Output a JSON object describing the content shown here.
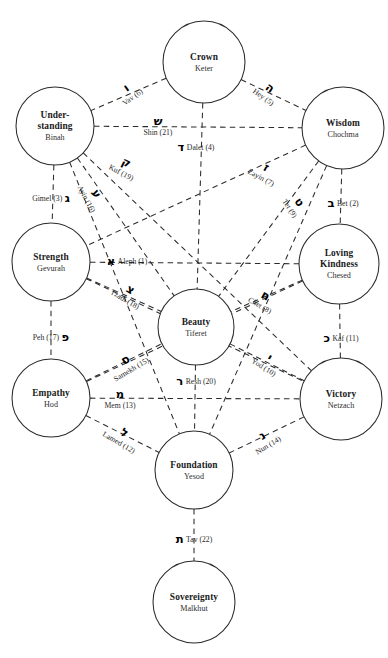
{
  "diagram": {
    "background": "#ffffff",
    "line_color": "#2b2b2b",
    "text_color": "#1b1b1b"
  },
  "sephirot": [
    {
      "id": "keter",
      "name": "Crown",
      "hebrew": "Keter",
      "cx": 204,
      "cy": 62,
      "r": 41
    },
    {
      "id": "binah",
      "name": "Under-\nstanding",
      "name_line1": "Under-",
      "name_line2": "standing",
      "hebrew": "Binah",
      "cx": 55,
      "cy": 126,
      "r": 39
    },
    {
      "id": "chochma",
      "name": "Wisdom",
      "hebrew": "Chochma",
      "cx": 343,
      "cy": 128,
      "r": 41
    },
    {
      "id": "gevurah",
      "name": "Strength",
      "hebrew": "Gevurah",
      "cx": 51,
      "cy": 262,
      "r": 39
    },
    {
      "id": "chesed",
      "name": "Loving\nKindness",
      "name_line1": "Loving",
      "name_line2": "Kindness",
      "hebrew": "Chesed",
      "cx": 339,
      "cy": 264,
      "r": 40
    },
    {
      "id": "tiferet",
      "name": "Beauty",
      "hebrew": "Tiferet",
      "cx": 196,
      "cy": 327,
      "r": 38
    },
    {
      "id": "hod",
      "name": "Empathy",
      "hebrew": "Hod",
      "cx": 51,
      "cy": 398,
      "r": 39
    },
    {
      "id": "netzach",
      "name": "Victory",
      "hebrew": "Netzach",
      "cx": 341,
      "cy": 399,
      "r": 41
    },
    {
      "id": "yesod",
      "name": "Foundation",
      "hebrew": "Yesod",
      "cx": 194,
      "cy": 470,
      "r": 39
    },
    {
      "id": "malkhut",
      "name": "Sovereignty",
      "hebrew": "Malkhut",
      "cx": 194,
      "cy": 602,
      "r": 41
    }
  ],
  "paths": [
    {
      "id": "aleph",
      "letter": "א",
      "name": "Aleph",
      "number": 1,
      "caption": "Aleph (1)",
      "from": "gevurah",
      "to": "chesed",
      "lx": 127,
      "ly": 262,
      "rot": 0,
      "glyph_side": "left",
      "stack": false
    },
    {
      "id": "bet",
      "letter": "ב",
      "name": "Bet",
      "number": 2,
      "caption": "Bet (2)",
      "from": "chochma",
      "to": "chesed",
      "lx": 343,
      "ly": 204,
      "rot": 0,
      "glyph_side": "left",
      "stack": false
    },
    {
      "id": "gimel",
      "letter": "ג",
      "name": "Gimel",
      "number": 3,
      "caption": "Gimel (3)",
      "from": "binah",
      "to": "gevurah",
      "lx": 51,
      "ly": 199,
      "rot": 0,
      "glyph_side": "right",
      "stack": false
    },
    {
      "id": "dalet",
      "letter": "ד",
      "name": "Dalet",
      "number": 4,
      "caption": "Dalet (4)",
      "from": "keter",
      "to": "tiferet",
      "lx": 196,
      "ly": 148,
      "rot": 0,
      "glyph_side": "left",
      "stack": false
    },
    {
      "id": "hey",
      "letter": "ה",
      "name": "Hey",
      "number": 5,
      "caption": "Hey (5)",
      "from": "keter",
      "to": "chochma",
      "lx": 267,
      "ly": 92,
      "rot": 35,
      "glyph_side": "left",
      "stack": true
    },
    {
      "id": "vav",
      "letter": "ו",
      "name": "Vav",
      "number": 6,
      "caption": "Vav (6)",
      "from": "keter",
      "to": "binah",
      "lx": 129,
      "ly": 92,
      "rot": -35,
      "glyph_side": "left",
      "stack": true
    },
    {
      "id": "zayin",
      "letter": "ז",
      "name": "Zayin",
      "number": 7,
      "caption": "Zayin (7)",
      "from": "chochma",
      "to": "tiferet",
      "lx": 264,
      "ly": 172,
      "rot": 28,
      "glyph_side": "left",
      "stack": true
    },
    {
      "id": "chet",
      "letter": "ח",
      "name": "Chet",
      "number": 8,
      "caption": "Chet (8)",
      "from": "chesed",
      "to": "tiferet",
      "lx": 263,
      "ly": 300,
      "rot": 30,
      "glyph_side": "left",
      "stack": true
    },
    {
      "id": "tet",
      "letter": "ט",
      "name": "Tet",
      "number": 9,
      "caption": "Tet (9)",
      "from": "chochma",
      "to": "gevurah",
      "lx": 295,
      "ly": 205,
      "rot": 57,
      "glyph_side": "left",
      "stack": true
    },
    {
      "id": "yod",
      "letter": "י",
      "name": "Yod",
      "number": 10,
      "caption": "Yod (10)",
      "from": "tiferet",
      "to": "netzach",
      "lx": 267,
      "ly": 362,
      "rot": 32,
      "glyph_side": "left",
      "stack": true
    },
    {
      "id": "kaf",
      "letter": "כ",
      "name": "Kaf",
      "number": 11,
      "caption": "Kaf (11)",
      "from": "chesed",
      "to": "netzach",
      "lx": 341,
      "ly": 339,
      "rot": 0,
      "glyph_side": "left",
      "stack": false
    },
    {
      "id": "lamed",
      "letter": "ל",
      "name": "Lamed",
      "number": 12,
      "caption": "Lamed (12)",
      "from": "hod",
      "to": "yesod",
      "lx": 122,
      "ly": 437,
      "rot": 30,
      "glyph_side": "left",
      "stack": true
    },
    {
      "id": "mem",
      "letter": "מ",
      "name": "Mem",
      "number": 13,
      "caption": "Mem (13)",
      "from": "hod",
      "to": "netzach",
      "lx": 120,
      "ly": 399,
      "rot": 0,
      "glyph_side": "left",
      "stack": true
    },
    {
      "id": "nun",
      "letter": "נ",
      "name": "Nun",
      "number": 14,
      "caption": "Nun (14)",
      "from": "yesod",
      "to": "netzach",
      "lx": 265,
      "ly": 440,
      "rot": -31,
      "glyph_side": "left",
      "stack": true
    },
    {
      "id": "samekh",
      "letter": "ס",
      "name": "Samekh",
      "number": 15,
      "caption": "Samekh (15)",
      "from": "hod",
      "to": "tiferet",
      "lx": 128,
      "ly": 364,
      "rot": -31,
      "glyph_side": "left",
      "stack": true
    },
    {
      "id": "ayin",
      "letter": "ע",
      "name": "Ayin",
      "number": 16,
      "caption": "Ayin (16)",
      "from": "binah",
      "to": "tiferet",
      "lx": 92,
      "ly": 196,
      "rot": 62,
      "glyph_side": "left",
      "stack": true
    },
    {
      "id": "peh",
      "letter": "פ",
      "name": "Peh",
      "number": 17,
      "caption": "Peh (17)",
      "from": "gevurah",
      "to": "hod",
      "lx": 51,
      "ly": 338,
      "rot": 0,
      "glyph_side": "right",
      "stack": false
    },
    {
      "id": "tzadi",
      "letter": "צ",
      "name": "Tzadi",
      "number": 18,
      "caption": "Tzadi (18)",
      "from": "gevurah",
      "to": "tiferet",
      "lx": 128,
      "ly": 294,
      "rot": 30,
      "glyph_side": "left",
      "stack": true
    },
    {
      "id": "kuf",
      "letter": "ק",
      "name": "Kuf",
      "number": 19,
      "caption": "Kuf (19)",
      "from": "binah",
      "to": "netzach",
      "lx": 124,
      "ly": 167,
      "rot": 27,
      "glyph_side": "left",
      "stack": true
    },
    {
      "id": "resh",
      "letter": "ר",
      "name": "Resh",
      "number": 20,
      "caption": "Resh (20)",
      "from": "tiferet",
      "to": "yesod",
      "lx": 196,
      "ly": 382,
      "rot": 0,
      "glyph_side": "left",
      "stack": false
    },
    {
      "id": "shin",
      "letter": "ש",
      "name": "Shin",
      "number": 21,
      "caption": "Shin (21)",
      "from": "binah",
      "to": "chochma",
      "lx": 158,
      "ly": 126,
      "rot": 0,
      "glyph_side": "left",
      "stack": true
    },
    {
      "id": "tav",
      "letter": "ת",
      "name": "Tav",
      "number": 22,
      "caption": "Tav (22)",
      "from": "yesod",
      "to": "malkhut",
      "lx": 194,
      "ly": 540,
      "rot": 0,
      "glyph_side": "left",
      "stack": false
    }
  ],
  "extra_paths": [
    {
      "id": "chesed-gevurah-diag-a",
      "from": "chesed",
      "to": "hod"
    },
    {
      "id": "gevurah-netzach-diag",
      "from": "gevurah",
      "to": "netzach"
    },
    {
      "id": "binah-yesod-diag",
      "from": "binah",
      "to": "yesod"
    },
    {
      "id": "chochma-yesod-diag",
      "from": "chochma",
      "to": "yesod"
    }
  ]
}
